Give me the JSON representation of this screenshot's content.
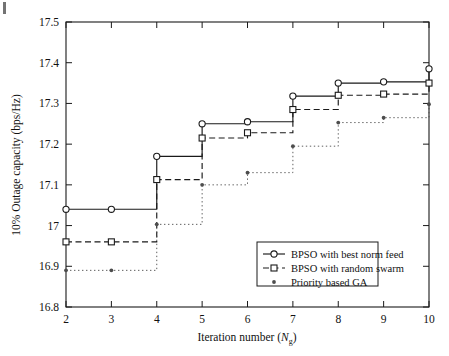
{
  "figure": {
    "background": "#ffffff",
    "axis_color": "#1a1a1a"
  },
  "chart_data": {
    "type": "line",
    "subtype": "step-post",
    "title": "",
    "xlabel": "Iteration number (N_g)",
    "xlabel_main": "Iteration number (",
    "xlabel_var": "N",
    "xlabel_sub": "g",
    "xlabel_close": ")",
    "ylabel": "10% Outage capacity (bps/Hz)",
    "x": [
      2,
      3,
      4,
      5,
      6,
      7,
      8,
      9,
      10
    ],
    "xlim": [
      2,
      10
    ],
    "ylim": [
      16.8,
      17.5
    ],
    "xticks": [
      2,
      3,
      4,
      5,
      6,
      7,
      8,
      9,
      10
    ],
    "xticklabels": [
      "2",
      "3",
      "4",
      "5",
      "6",
      "7",
      "8",
      "9",
      "10"
    ],
    "yticks": [
      16.8,
      16.9,
      17.0,
      17.1,
      17.2,
      17.3,
      17.4,
      17.5
    ],
    "yticklabels": [
      "16.8",
      "16.9",
      "17",
      "17.1",
      "17.2",
      "17.3",
      "17.4",
      "17.5"
    ],
    "grid": false,
    "legend_position": "lower right",
    "series": [
      {
        "name": "BPSO with best norm feed",
        "marker": "circle",
        "linestyle": "solid",
        "color": "#1a1a1a",
        "values": [
          17.04,
          17.04,
          17.17,
          17.25,
          17.255,
          17.318,
          17.35,
          17.353,
          17.385
        ]
      },
      {
        "name": "BPSO with random swarm",
        "marker": "square",
        "linestyle": "dashed",
        "color": "#1a1a1a",
        "values": [
          16.96,
          16.96,
          17.113,
          17.215,
          17.228,
          17.285,
          17.32,
          17.323,
          17.35
        ]
      },
      {
        "name": "Priority based GA",
        "marker": "dot",
        "linestyle": "dotted",
        "color": "#4d4d4d",
        "values": [
          16.89,
          16.89,
          17.003,
          17.1,
          17.13,
          17.195,
          17.253,
          17.265,
          17.298
        ]
      }
    ]
  },
  "legend": {
    "entries": [
      {
        "label": "BPSO with best norm feed",
        "marker": "circle",
        "linestyle": "solid"
      },
      {
        "label": "BPSO with random swarm",
        "marker": "square",
        "linestyle": "dashed"
      },
      {
        "label": "Priority based GA",
        "marker": "dot",
        "linestyle": "dotted"
      }
    ]
  }
}
